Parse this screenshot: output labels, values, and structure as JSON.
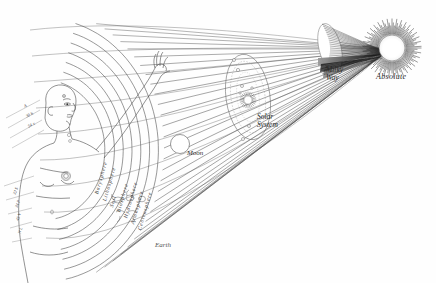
{
  "figure": {
    "background_color": "#fefefe",
    "ink_color": "#333333"
  },
  "cosmic_nodes": [
    {
      "id": "absolute",
      "label": "Absolute",
      "x": 398,
      "y": 45,
      "type": "sunburst"
    },
    {
      "id": "milky-way",
      "label": "Milky\nWay",
      "x": 333,
      "y": 60,
      "type": "disc"
    },
    {
      "id": "solar-system",
      "label": "Solar\nSystem",
      "x": 252,
      "y": 110,
      "type": "ellipse"
    },
    {
      "id": "moon",
      "label": "Moon",
      "x": 181,
      "y": 148,
      "type": "circle"
    },
    {
      "id": "earth",
      "label": "Earth",
      "x": 162,
      "y": 243,
      "type": "text"
    }
  ],
  "earth_layers": [
    {
      "index": 0,
      "label": "Barysphere"
    },
    {
      "index": 1,
      "label": "Lithosphere"
    },
    {
      "index": 2,
      "label": "Soil"
    },
    {
      "index": 3,
      "label": "Biosphere"
    },
    {
      "index": 4,
      "label": "Hydrosphere"
    },
    {
      "index": 5,
      "label": "Atmosphere"
    },
    {
      "index": 6,
      "label": "Centrosphere"
    }
  ],
  "body_annotations": [
    {
      "id": "head-marks",
      "lines": [
        "A",
        "30 h",
        "54 x"
      ]
    },
    {
      "id": "torso-marks",
      "lines": [
        "32 S",
        "34 P",
        "45 V",
        "N L"
      ]
    }
  ],
  "solar_bodies": [
    {
      "glyph": "♃",
      "name": "jupiter-glyph"
    },
    {
      "glyph": "♄",
      "name": "saturn-glyph"
    },
    {
      "glyph": "☉",
      "name": "sun-glyph"
    },
    {
      "glyph": "♀",
      "name": "venus-glyph"
    },
    {
      "glyph": "♂",
      "name": "mars-glyph"
    }
  ]
}
